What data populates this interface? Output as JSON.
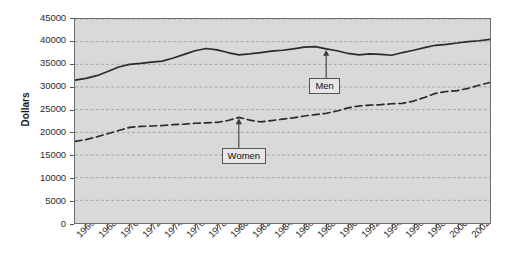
{
  "chart_data": {
    "type": "line",
    "title": "",
    "xlabel": "",
    "ylabel": "Dollars",
    "xlim": [
      1965,
      2003
    ],
    "ylim": [
      0,
      45000
    ],
    "grid": true,
    "grid_axis": "y",
    "legend_position": "inline-annotations",
    "y_ticks": [
      0,
      5000,
      10000,
      15000,
      20000,
      25000,
      30000,
      35000,
      40000,
      45000
    ],
    "y_tick_labels": [
      "0",
      "5000",
      "10000",
      "15000",
      "20000",
      "25000",
      "30000",
      "35000",
      "40000",
      "45000"
    ],
    "x_ticks": [
      1966,
      1968,
      1970,
      1972,
      1974,
      1976,
      1978,
      1980,
      1982,
      1984,
      1986,
      1988,
      1990,
      1992,
      1994,
      1996,
      1998,
      2000,
      2002
    ],
    "x_tick_labels": [
      "1966",
      "1968",
      "1970",
      "1972",
      "1974",
      "1976",
      "1978",
      "1980",
      "1982",
      "1984",
      "1986",
      "1988",
      "1990",
      "1992",
      "1994",
      "1996",
      "1998",
      "2000",
      "2002"
    ],
    "x": [
      1965,
      1966,
      1967,
      1968,
      1969,
      1970,
      1971,
      1972,
      1973,
      1974,
      1975,
      1976,
      1977,
      1978,
      1979,
      1980,
      1981,
      1982,
      1983,
      1984,
      1985,
      1986,
      1987,
      1988,
      1989,
      1990,
      1991,
      1992,
      1993,
      1994,
      1995,
      1996,
      1997,
      1998,
      1999,
      2000,
      2001,
      2002,
      2003
    ],
    "series": [
      {
        "name": "Men",
        "style": "solid",
        "color": "#2b2b2b",
        "values": [
          31500,
          31900,
          32500,
          33400,
          34400,
          35000,
          35200,
          35500,
          35700,
          36400,
          37200,
          38000,
          38500,
          38200,
          37600,
          37100,
          37300,
          37600,
          37900,
          38100,
          38400,
          38800,
          38900,
          38400,
          38000,
          37400,
          37100,
          37300,
          37200,
          37000,
          37600,
          38100,
          38700,
          39200,
          39400,
          39700,
          40000,
          40200,
          40500
        ]
      },
      {
        "name": "Women",
        "style": "dashed",
        "color": "#2b2b2b",
        "values": [
          18000,
          18400,
          19000,
          19700,
          20400,
          21100,
          21300,
          21400,
          21500,
          21700,
          21800,
          22000,
          22100,
          22200,
          22600,
          23300,
          22700,
          22300,
          22600,
          22900,
          23200,
          23600,
          23900,
          24200,
          24700,
          25400,
          25800,
          26000,
          26100,
          26300,
          26400,
          26900,
          27700,
          28600,
          29000,
          29200,
          29700,
          30400,
          31000
        ]
      }
    ],
    "annotations": [
      {
        "name": "Men",
        "label": "Men",
        "points_to_year": 1988,
        "points_to_value": 38400
      },
      {
        "name": "Women",
        "label": "Women",
        "points_to_year": 1980,
        "points_to_value": 23300
      }
    ]
  }
}
